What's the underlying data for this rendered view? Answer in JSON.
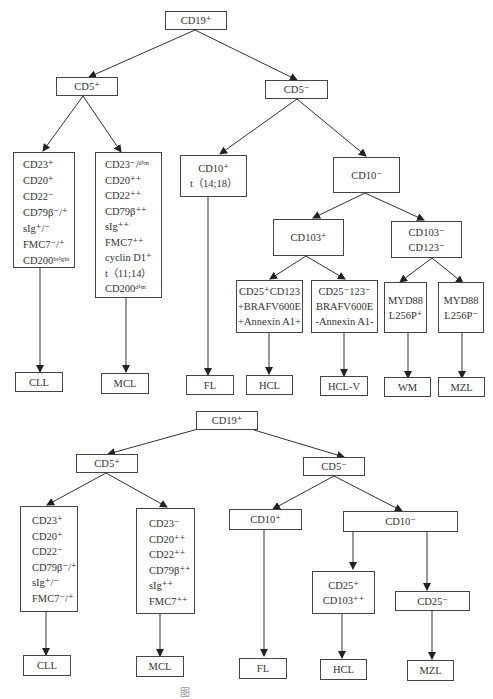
{
  "diagram_top": {
    "root": "CD19⁺",
    "cd5_pos": "CD5⁺",
    "cd5_neg": "CD5⁻",
    "cll_markers": [
      "CD23⁺",
      "CD20⁺",
      "CD22⁻",
      "CD79β⁻/⁺",
      "sIg⁺/⁻",
      "FMC7⁻/⁺",
      "CD200ᵇʳⁱᵍʰᵗ"
    ],
    "mcl_markers": [
      "CD23⁻/ᵈⁱᵐ",
      "CD20⁺⁺",
      "CD22⁺⁺",
      "CD79β⁺⁺",
      "sIg⁺⁺",
      "FMC7⁺⁺",
      "cyclin D1⁺",
      "t（11;14）",
      "CD200ᵈⁱᵐ"
    ],
    "cd10_pos": [
      "CD10⁺",
      "t（14;18）"
    ],
    "cd10_neg": "CD10⁻",
    "cd103_pos": "CD103⁺",
    "cd103_neg": [
      "CD103⁻",
      "CD123⁻"
    ],
    "hcl_markers": [
      "CD25⁺CD123",
      "+BRAFV600E",
      "+Annexin A1+"
    ],
    "hclv_markers": [
      "CD25⁻123⁻",
      "BRAFV600E",
      "-Annexin A1-"
    ],
    "wm_markers": [
      "MYD88",
      "L256P⁺"
    ],
    "mzl_markers": [
      "MYD88",
      "L256P⁻"
    ],
    "leaves": {
      "cll": "CLL",
      "mcl": "MCL",
      "fl": "FL",
      "hcl": "HCL",
      "hclv": "HCL-V",
      "wm": "WM",
      "mzl": "MZL"
    }
  },
  "diagram_bottom": {
    "root": "CD19⁺",
    "cd5_pos": "CD5⁺",
    "cd5_neg": "CD5⁻",
    "cll_markers": [
      "CD23⁺",
      "CD20⁺",
      "CD22⁻",
      "CD79β⁻/⁺",
      "sIg⁺/⁻",
      "FMC7⁻/⁺"
    ],
    "mcl_markers": [
      "CD23⁻",
      "CD20⁺⁺",
      "CD22⁺⁺",
      "CD79β⁺⁺",
      "sIg⁺⁺",
      "FMC7⁺⁺"
    ],
    "cd10_pos": "CD10⁺",
    "cd10_neg": "CD10⁻",
    "hcl_markers": [
      "CD25⁺",
      "CD103⁺⁺"
    ],
    "cd25_neg": "CD25⁻",
    "leaves": {
      "cll": "CLL",
      "mcl": "MCL",
      "fl": "FL",
      "hcl": "HCL",
      "mzl": "MZL"
    }
  },
  "caption": "图"
}
